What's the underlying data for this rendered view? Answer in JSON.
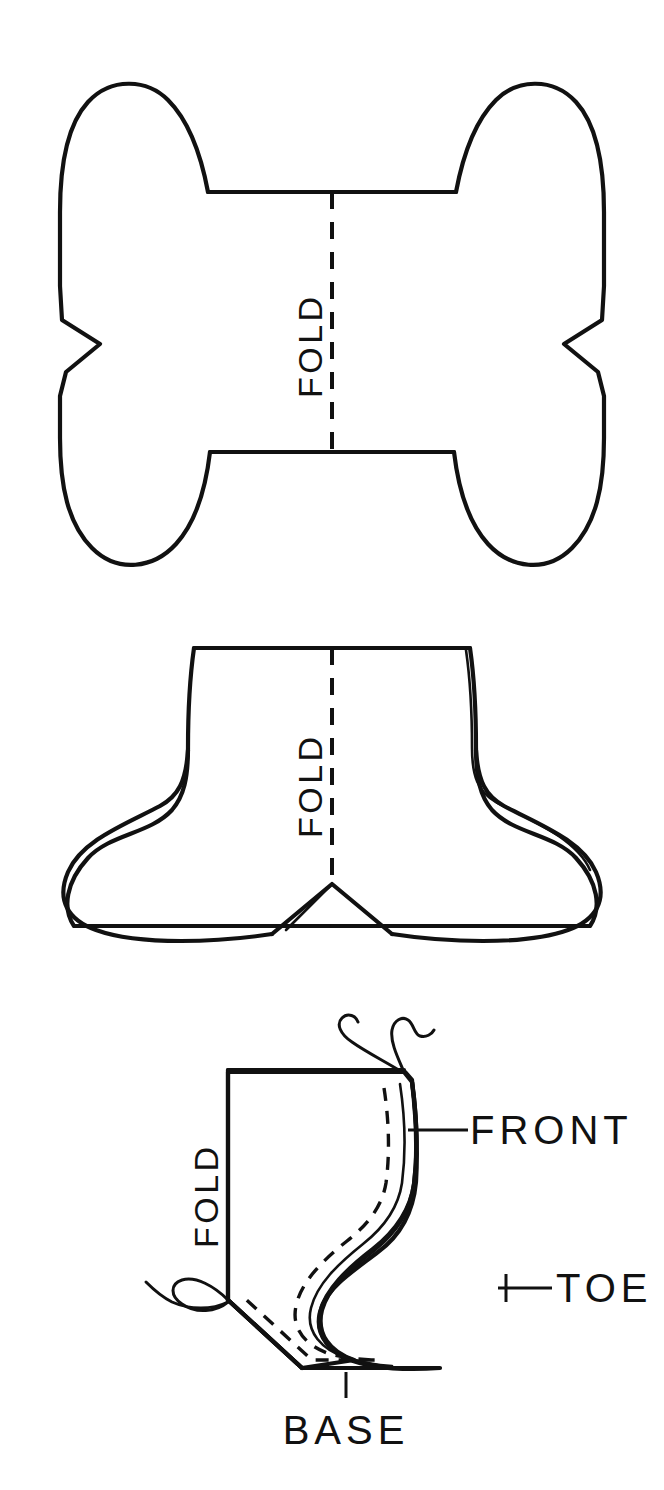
{
  "diagram": {
    "background_color": "#ffffff",
    "ink_color": "#111111",
    "width": 664,
    "height": 1490
  },
  "figures": [
    {
      "id": "figure-flat-pattern",
      "name": "flat-pattern",
      "description": "Unfolded butterfly-shaped bootie pattern piece, symmetric about a vertical fold line",
      "fold_label": "FOLD",
      "fold_line_style": "dashed",
      "labels": []
    },
    {
      "id": "figure-folded-pair",
      "name": "folded-pair",
      "description": "Pattern folded in half showing two mirrored boot shapes joined at the cuff with a center notch",
      "fold_label": "FOLD",
      "fold_line_style": "dashed",
      "labels": []
    },
    {
      "id": "figure-finished-boot",
      "name": "finished-boot",
      "description": "Single finished bootie with stitch line, showing sewing thread at cuff and heel",
      "fold_label": "FOLD",
      "fold_line_style": "solid",
      "labels": [
        {
          "key": "front",
          "text": "FRONT",
          "leader": "horizontal-left"
        },
        {
          "key": "toe",
          "text": "TOE",
          "leader": "horizontal-left-with-tick"
        },
        {
          "key": "base",
          "text": "BASE",
          "leader": "vertical-up"
        }
      ]
    }
  ],
  "labels": {
    "fold": "FOLD",
    "front": "FRONT",
    "toe": "TOE",
    "base": "BASE"
  }
}
